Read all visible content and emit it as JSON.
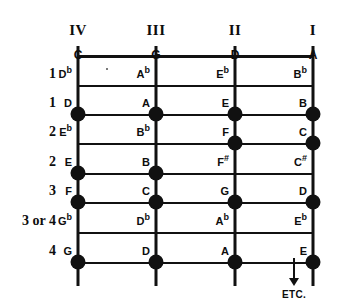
{
  "diagram": {
    "ink_color": "#111111",
    "background": "#ffffff",
    "strings": [
      {
        "roman": "IV",
        "open_note": "C",
        "x": 78
      },
      {
        "roman": "III",
        "open_note": "G",
        "x": 156
      },
      {
        "roman": "II",
        "open_note": "D",
        "x": 235
      },
      {
        "roman": "I",
        "open_note": "A",
        "x": 313
      }
    ],
    "rows": [
      {
        "finger": "1",
        "stopped": false,
        "notes": [
          {
            "letter": "D",
            "accidental": "b"
          },
          {
            "letter": "A",
            "accidental": "b"
          },
          {
            "letter": "E",
            "accidental": "b"
          },
          {
            "letter": "B",
            "accidental": "b"
          }
        ],
        "dots": [
          false,
          false,
          false,
          false
        ]
      },
      {
        "finger": "1",
        "stopped": true,
        "notes": [
          {
            "letter": "D",
            "accidental": ""
          },
          {
            "letter": "A",
            "accidental": ""
          },
          {
            "letter": "E",
            "accidental": ""
          },
          {
            "letter": "B",
            "accidental": ""
          }
        ],
        "dots": [
          true,
          true,
          true,
          true
        ]
      },
      {
        "finger": "2",
        "stopped": false,
        "notes": [
          {
            "letter": "E",
            "accidental": "b"
          },
          {
            "letter": "B",
            "accidental": "b"
          },
          {
            "letter": "F",
            "accidental": ""
          },
          {
            "letter": "C",
            "accidental": ""
          }
        ],
        "dots": [
          false,
          false,
          true,
          true
        ]
      },
      {
        "finger": "2",
        "stopped": true,
        "notes": [
          {
            "letter": "E",
            "accidental": ""
          },
          {
            "letter": "B",
            "accidental": ""
          },
          {
            "letter": "F",
            "accidental": "#"
          },
          {
            "letter": "C",
            "accidental": "#"
          }
        ],
        "dots": [
          true,
          true,
          false,
          false
        ]
      },
      {
        "finger": "3",
        "stopped": true,
        "notes": [
          {
            "letter": "F",
            "accidental": ""
          },
          {
            "letter": "C",
            "accidental": ""
          },
          {
            "letter": "G",
            "accidental": ""
          },
          {
            "letter": "D",
            "accidental": ""
          }
        ],
        "dots": [
          true,
          true,
          true,
          true
        ]
      },
      {
        "finger": "3 or 4",
        "stopped": false,
        "notes": [
          {
            "letter": "G",
            "accidental": "b"
          },
          {
            "letter": "D",
            "accidental": "b"
          },
          {
            "letter": "A",
            "accidental": "b"
          },
          {
            "letter": "E",
            "accidental": "b"
          }
        ],
        "dots": [
          false,
          false,
          false,
          false
        ]
      },
      {
        "finger": "4",
        "stopped": true,
        "notes": [
          {
            "letter": "G",
            "accidental": ""
          },
          {
            "letter": "D",
            "accidental": ""
          },
          {
            "letter": "A",
            "accidental": ""
          },
          {
            "letter": "E",
            "accidental": ""
          }
        ],
        "dots": [
          true,
          true,
          true,
          true
        ]
      }
    ],
    "fret_y": [
      55,
      85,
      114,
      143,
      173,
      202,
      232,
      262
    ],
    "string_top_y": 46,
    "string_bottom_y": 286,
    "roman_y": 22,
    "open_name_y": 48,
    "continuation": {
      "label": "ETC.",
      "arrow": "down-arrow",
      "x": 294,
      "y": 258
    }
  }
}
